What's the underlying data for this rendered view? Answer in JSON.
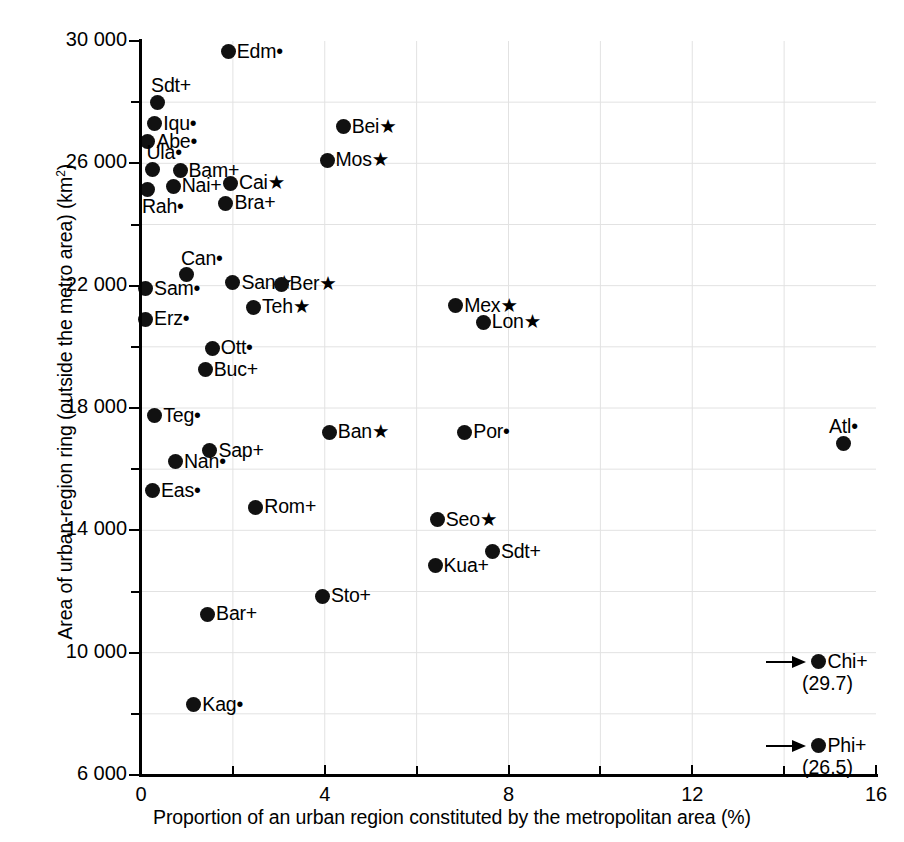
{
  "chart_data": {
    "type": "scatter",
    "title": "",
    "xlabel": "Proportion of an urban region constituted by the metropolitan area (%)",
    "ylabel": "Area of urban-region ring (outside the metro area) (km2)",
    "ylabel_html": "Area of urban-region ring (outside the metro area) (km²)",
    "xlim": [
      0,
      16
    ],
    "ylim": [
      6000,
      30000
    ],
    "xticks": [
      0,
      4,
      8,
      12,
      16
    ],
    "xtick_labels": [
      "0",
      "4",
      "8",
      "12",
      "16"
    ],
    "xminor_ticks": [
      2,
      6,
      10,
      14
    ],
    "yticks": [
      6000,
      10000,
      14000,
      18000,
      22000,
      26000,
      30000
    ],
    "ytick_labels": [
      "6 000",
      "10 000",
      "14 000",
      "18 000",
      "22 000",
      "26 000",
      "30 000"
    ],
    "yminor_ticks": [
      8000,
      12000,
      16000,
      20000,
      24000,
      28000
    ],
    "grid": true,
    "legend": "none",
    "marker": "filled-circle",
    "points": [
      {
        "name": "Edm",
        "suffix": "dot",
        "x": 1.9,
        "y": 29650,
        "label_side": "right"
      },
      {
        "name": "Bei",
        "suffix": "star",
        "x": 4.4,
        "y": 27200,
        "label_side": "right"
      },
      {
        "name": "Sdt",
        "suffix": "plus",
        "x": 0.35,
        "y": 28000,
        "label_side": "above-right"
      },
      {
        "name": "Iqu",
        "suffix": "dot",
        "x": 0.3,
        "y": 27300,
        "label_side": "right"
      },
      {
        "name": "Abe",
        "suffix": "dot",
        "x": 0.15,
        "y": 26700,
        "label_side": "right"
      },
      {
        "name": "Mos",
        "suffix": "star",
        "x": 4.05,
        "y": 26100,
        "label_side": "right"
      },
      {
        "name": "Ula",
        "suffix": "dot",
        "x": 0.25,
        "y": 25800,
        "label_side": "above-right"
      },
      {
        "name": "Bam",
        "suffix": "plus",
        "x": 0.85,
        "y": 25750,
        "label_side": "right"
      },
      {
        "name": "Nai",
        "suffix": "plus",
        "x": 0.7,
        "y": 25250,
        "label_side": "right"
      },
      {
        "name": "Cai",
        "suffix": "star",
        "x": 1.95,
        "y": 25350,
        "label_side": "right"
      },
      {
        "name": "Rah",
        "suffix": "dot",
        "x": 0.15,
        "y": 25150,
        "label_side": "below-right"
      },
      {
        "name": "Bra",
        "suffix": "plus",
        "x": 1.85,
        "y": 24700,
        "label_side": "right"
      },
      {
        "name": "Can",
        "suffix": "dot",
        "x": 1.0,
        "y": 22350,
        "label_side": "above-right"
      },
      {
        "name": "San",
        "suffix": "star",
        "x": 2.0,
        "y": 22100,
        "label_side": "right"
      },
      {
        "name": "Ber",
        "suffix": "star",
        "x": 3.05,
        "y": 22050,
        "label_side": "right"
      },
      {
        "name": "Sam",
        "suffix": "dot",
        "x": 0.1,
        "y": 21900,
        "label_side": "right"
      },
      {
        "name": "Teh",
        "suffix": "star",
        "x": 2.45,
        "y": 21300,
        "label_side": "right"
      },
      {
        "name": "Mex",
        "suffix": "star",
        "x": 6.85,
        "y": 21350,
        "label_side": "right"
      },
      {
        "name": "Lon",
        "suffix": "star",
        "x": 7.45,
        "y": 20800,
        "label_side": "right"
      },
      {
        "name": "Erz",
        "suffix": "dot",
        "x": 0.1,
        "y": 20900,
        "label_side": "right"
      },
      {
        "name": "Ott",
        "suffix": "dot",
        "x": 1.55,
        "y": 19950,
        "label_side": "right"
      },
      {
        "name": "Buc",
        "suffix": "plus",
        "x": 1.4,
        "y": 19250,
        "label_side": "right"
      },
      {
        "name": "Teg",
        "suffix": "dot",
        "x": 0.3,
        "y": 17750,
        "label_side": "right"
      },
      {
        "name": "Ban",
        "suffix": "star",
        "x": 4.1,
        "y": 17200,
        "label_side": "right"
      },
      {
        "name": "Por",
        "suffix": "dot",
        "x": 7.05,
        "y": 17200,
        "label_side": "right"
      },
      {
        "name": "Atl",
        "suffix": "dot",
        "x": 15.3,
        "y": 16850,
        "label_side": "above"
      },
      {
        "name": "Sap",
        "suffix": "plus",
        "x": 1.5,
        "y": 16600,
        "label_side": "right"
      },
      {
        "name": "Nan",
        "suffix": "dot",
        "x": 0.75,
        "y": 16250,
        "label_side": "right"
      },
      {
        "name": "Eas",
        "suffix": "dot",
        "x": 0.25,
        "y": 15300,
        "label_side": "right"
      },
      {
        "name": "Rom",
        "suffix": "plus",
        "x": 2.5,
        "y": 14750,
        "label_side": "right"
      },
      {
        "name": "Seo",
        "suffix": "star",
        "x": 6.45,
        "y": 14350,
        "label_side": "right"
      },
      {
        "name": "Sdt2",
        "display": "Sdt",
        "suffix": "plus",
        "x": 7.65,
        "y": 13300,
        "label_side": "right"
      },
      {
        "name": "Kua",
        "suffix": "plus",
        "x": 6.4,
        "y": 12850,
        "label_side": "right"
      },
      {
        "name": "Sto",
        "suffix": "plus",
        "x": 3.95,
        "y": 11850,
        "label_side": "right"
      },
      {
        "name": "Bar",
        "suffix": "plus",
        "x": 1.45,
        "y": 11250,
        "label_side": "right"
      },
      {
        "name": "Kag",
        "suffix": "dot",
        "x": 1.15,
        "y": 8300,
        "label_side": "right"
      }
    ],
    "offscale_points": [
      {
        "name": "Chi",
        "suffix": "plus",
        "x_actual": 29.7,
        "x_display_label": "(29.7)",
        "y": 9700,
        "arrow": true
      },
      {
        "name": "Phi",
        "suffix": "plus",
        "x_actual": 26.5,
        "x_display_label": "(26.5)",
        "y": 6950,
        "arrow": true
      }
    ],
    "symbols": {
      "star": "★",
      "plus": "+",
      "dot": "•"
    }
  },
  "colors": {
    "marker": "#111111",
    "axis": "#000000",
    "grid": "#dedede",
    "background": "#ffffff"
  }
}
